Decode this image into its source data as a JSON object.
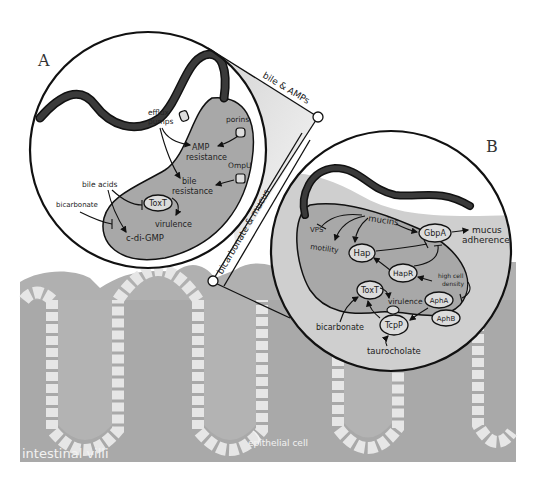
{
  "panels": {
    "A": {
      "letter": "A",
      "connector_label": "bile & AMPs",
      "labels": {
        "efflux_pumps_1": "efflux",
        "efflux_pumps_2": "pumps",
        "porins": "porins",
        "amp_resistance_1": "AMP",
        "amp_resistance_2": "resistance",
        "ompu": "OmpU",
        "bile_resistance_1": "bile",
        "bile_resistance_2": "resistance",
        "bile_acids": "bile acids",
        "bicarbonate": "bicarbonate",
        "toxt": "ToxT",
        "virulence": "virulence",
        "c_di_gmp": "c-di-GMP"
      }
    },
    "B": {
      "letter": "B",
      "connector_label": "bicarbonate & mucus",
      "labels": {
        "mucins": "mucins",
        "vps": "VPS",
        "motility": "motility",
        "hap": "Hap",
        "gbpa": "GbpA",
        "mucus_adherence_1": "mucus",
        "mucus_adherence_2": "adherence",
        "hapr": "HapR",
        "high_cell_density_1": "high cell",
        "high_cell_density_2": "density",
        "toxt": "ToxT",
        "virulence": "virulence",
        "apha": "AphA",
        "aphb": "AphB",
        "tcpp": "TcpP",
        "bicarbonate": "bicarbonate",
        "taurocholate": "taurocholate"
      }
    }
  },
  "background": {
    "intestinal_villi": "intestinal villi",
    "epithelial_cell": "epithelial cell"
  },
  "colors": {
    "tissue": "#a9a9a9",
    "villus_core": "#b4b4b4",
    "epithelium": "#e6e6e6",
    "mucus": "#cfcfcf",
    "cell_body": "#a8a8a8",
    "flagellum": "#3a3a3a",
    "outline": "#111111"
  }
}
